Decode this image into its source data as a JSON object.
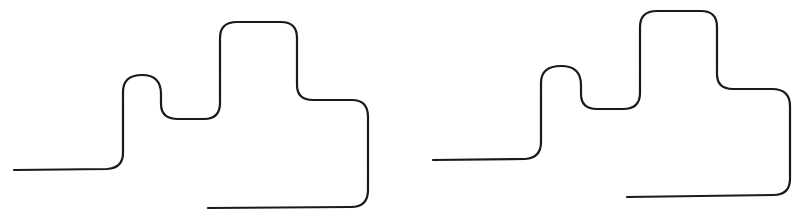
{
  "figure": {
    "background": "#ffffff",
    "stroke_color": "#1a1a1a",
    "stroke_width": 2.2,
    "cutoff_text_hint": "",
    "paths": [
      {
        "id": "left-path",
        "label": "",
        "d": "M14,170 L107,169 Q123,168 123,153 L123,92 Q123,75 142,75 Q161,75 161,94 L161,104 Q161,119 178,119 L204,119 Q220,119 220,103 L220,38 Q220,22 237,22 L281,22 Q297,22 297,38 L297,85 Q297,100 313,100 L352,100 Q368,100 368,117 L368,190 Q368,207 351,207 L208,208"
      },
      {
        "id": "right-path",
        "label": "",
        "d": "M433,160 L525,159 Q541,158 541,142 L541,83 Q541,66 561,66 Q581,66 581,85 L581,94 Q581,109 597,109 L623,109 Q640,109 640,93 L640,27 Q640,11 657,11 L701,11 Q717,11 717,27 L717,74 Q717,89 733,89 L772,89 Q790,89 790,106 L790,179 Q790,195 773,195 L627,197"
      }
    ]
  }
}
